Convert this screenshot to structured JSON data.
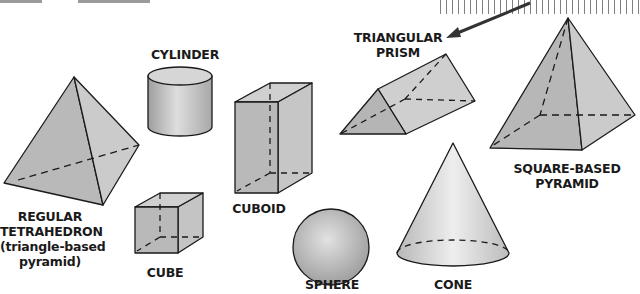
{
  "figure": {
    "colors": {
      "fill": "#bdbdbd",
      "fill_light": "#d4d4d4",
      "stroke": "#1a1a1a",
      "arrow": "#333333"
    },
    "shapes": [
      {
        "id": "tetrahedron",
        "label_lines": [
          "REGULAR",
          "TETRAHEDRON",
          "(triangle-based",
          "pyramid)"
        ]
      },
      {
        "id": "cylinder",
        "label_lines": [
          "CYLINDER"
        ]
      },
      {
        "id": "cube",
        "label_lines": [
          "CUBE"
        ]
      },
      {
        "id": "cuboid",
        "label_lines": [
          "CUBOID"
        ]
      },
      {
        "id": "sphere",
        "label_lines": [
          "SPHERE"
        ]
      },
      {
        "id": "triangular-prism",
        "label_lines": [
          "TRIANGULAR",
          "PRISM"
        ]
      },
      {
        "id": "cone",
        "label_lines": [
          "CONE"
        ]
      },
      {
        "id": "square-pyramid",
        "label_lines": [
          "SQUARE-BASED",
          "PYRAMID"
        ]
      }
    ]
  }
}
